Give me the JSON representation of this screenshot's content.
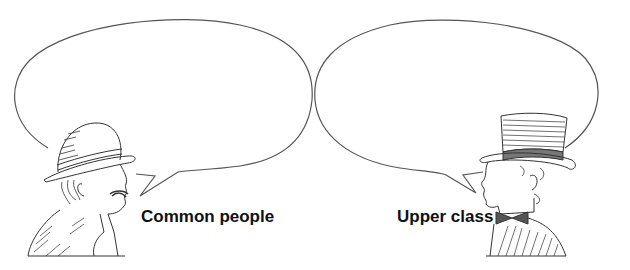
{
  "figure": {
    "colors": {
      "line": "#555555",
      "text": "#111111",
      "background": "#ffffff"
    }
  },
  "speakers": [
    {
      "id": "left",
      "label": "Common people",
      "hat": "bowler-hat",
      "bubble_text": ""
    },
    {
      "id": "right",
      "label": "Upper class",
      "hat": "top-hat",
      "bubble_text": ""
    }
  ]
}
